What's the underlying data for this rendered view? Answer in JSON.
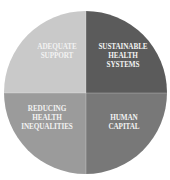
{
  "diagram": {
    "type": "quadrant-pie",
    "quadrants": [
      {
        "id": "top-left",
        "label": "ADEQUATE\nSUPPORT",
        "color": "#c9c9c9"
      },
      {
        "id": "top-right",
        "label": "SUSTAINABLE\nHEALTH\nSYSTEMS",
        "color": "#5b5b5b"
      },
      {
        "id": "bottom-left",
        "label": "REDUCING\nHEALTH\nINEQUALITIES",
        "color": "#9b9b9b"
      },
      {
        "id": "bottom-right",
        "label": "HUMAN\nCAPITAL",
        "color": "#787878"
      }
    ],
    "label_color": "#f2f2f2",
    "background": "#ffffff"
  }
}
